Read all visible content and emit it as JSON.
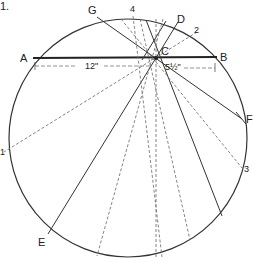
{
  "figure": {
    "number_label": "1.",
    "labels": {
      "A": "A",
      "B": "B",
      "C": "C",
      "D": "D",
      "E": "E",
      "F": "F",
      "G": "G",
      "n1": "1",
      "n2": "2",
      "n3": "3",
      "n4": "4"
    },
    "dimensions": {
      "ac": "12\"",
      "cb": "5½\""
    }
  },
  "colors": {
    "line": "#333333",
    "dashed": "#777777",
    "background": "#ffffff"
  }
}
